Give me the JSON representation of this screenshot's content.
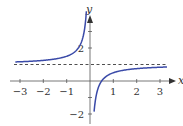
{
  "chart_data": {
    "type": "line",
    "title": "",
    "xlabel": "x",
    "ylabel": "y",
    "function": "y = 1 - 1/(2x)",
    "xlim": [
      -3.2,
      3.3
    ],
    "ylim": [
      -2.3,
      3.8
    ],
    "x_ticks": [
      -3,
      -2,
      -1,
      1,
      2,
      3
    ],
    "x_tick_labels": [
      "−3",
      "−2",
      "−1",
      "1",
      "2",
      "3"
    ],
    "y_ticks": [
      -2,
      -1,
      1,
      2,
      3
    ],
    "y_tick_labels": [
      "−2",
      "2"
    ],
    "asymptotes": {
      "horizontal": 1,
      "vertical": 0
    },
    "series": [
      {
        "name": "left branch",
        "x": [
          -3.2,
          -3,
          -2,
          -1,
          -0.5,
          -0.3,
          -0.2,
          -0.15
        ],
        "y": [
          1.16,
          1.17,
          1.25,
          1.5,
          2.0,
          2.67,
          3.5,
          4.33
        ]
      },
      {
        "name": "right branch",
        "x": [
          0.11,
          0.15,
          0.25,
          0.5,
          1,
          2,
          3,
          3.3
        ],
        "y": [
          -3.5,
          -2.33,
          -1.0,
          0.0,
          0.5,
          0.75,
          0.83,
          0.85
        ]
      }
    ],
    "curve_color": "#3a4aa8",
    "grid": false,
    "legend": null
  },
  "labels": {
    "x_axis": "x",
    "y_axis": "y",
    "xt": [
      "−3",
      "−2",
      "−1",
      "1",
      "2",
      "3"
    ],
    "yt_pos2": "2",
    "yt_neg2": "−2"
  }
}
